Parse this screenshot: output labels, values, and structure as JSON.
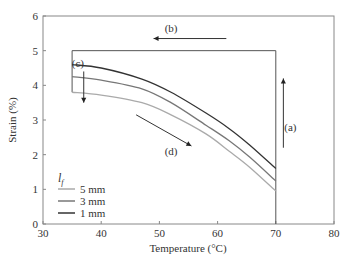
{
  "chart_data": {
    "type": "line",
    "title": "",
    "xlabel": "Temperature (°C)",
    "ylabel": "Strain (%)",
    "xlim": [
      30,
      80
    ],
    "ylim": [
      0,
      6
    ],
    "xticks": [
      30,
      40,
      50,
      60,
      70,
      80
    ],
    "yticks": [
      0,
      1,
      2,
      3,
      4,
      5,
      6
    ],
    "grid": false,
    "legend": {
      "title": "l_f",
      "title_main": "l",
      "title_sub": "f",
      "position": "lower left",
      "entries": [
        "5 mm",
        "3 mm",
        "1 mm"
      ]
    },
    "x": [
      35,
      40,
      47,
      52,
      58,
      62,
      65.5,
      70
    ],
    "series": [
      {
        "name": "1 mm",
        "color": "#333333",
        "values": [
          4.6,
          4.5,
          4.18,
          3.8,
          3.2,
          2.75,
          2.28,
          1.6
        ]
      },
      {
        "name": "3 mm",
        "color": "#777777",
        "values": [
          4.25,
          4.15,
          3.9,
          3.5,
          2.85,
          2.4,
          1.93,
          1.24
        ]
      },
      {
        "name": "5 mm",
        "color": "#aaaaaa",
        "values": [
          3.8,
          3.72,
          3.5,
          3.15,
          2.6,
          2.1,
          1.64,
          0.95
        ]
      }
    ],
    "cycle_path": {
      "description": "thermo-mechanical cycle outline",
      "points": [
        [
          70,
          0
        ],
        [
          70,
          5
        ],
        [
          35,
          5
        ],
        [
          35,
          3.8
        ]
      ]
    },
    "annotations": [
      {
        "label": "(a)",
        "x": 72.5,
        "y": 2.8,
        "arrow": "up",
        "arrow_x": 71.3,
        "arrow_from": 2.2,
        "arrow_to": 4.2
      },
      {
        "label": "(b)",
        "x": 52,
        "y": 5.65,
        "arrow": "left",
        "arrow_y": 5.35,
        "arrow_from": 61.5,
        "arrow_to": 49
      },
      {
        "label": "(c)",
        "x": 36,
        "y": 4.65,
        "arrow": "down",
        "arrow_x": 37,
        "arrow_from": 4.4,
        "arrow_to": 3.5
      },
      {
        "label": "(d)",
        "x": 52,
        "y": 2.1,
        "arrow": "down-right",
        "from": [
          46,
          3.15
        ],
        "to": [
          55.5,
          2.25
        ]
      }
    ]
  }
}
